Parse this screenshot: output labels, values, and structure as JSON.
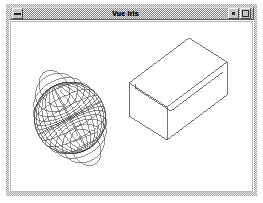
{
  "window": {
    "title": "Vue Iris",
    "menu_button": "window-menu",
    "minimize_button": "minimize",
    "maximize_button": "maximize",
    "background_color": "#ffffff",
    "frame_color": "#9a9a9a",
    "titlebar_color": "#c6c6c6"
  },
  "scene": {
    "name": "3d-wireframe-scene",
    "line_color": "#3a3a3a",
    "projection": "parallel",
    "objects": [
      {
        "name": "wireframe-sphere",
        "label": "Sphere",
        "type": "sphere",
        "center": [
          64,
          113
        ],
        "radius": 36,
        "meridians": 16,
        "parallels": 12,
        "tilt_deg": 28
      },
      {
        "name": "open-box",
        "label": "Box",
        "type": "box",
        "open_top": true,
        "front_left": [
          124,
          78
        ],
        "top_back": [
          184,
          33
        ],
        "right": [
          222,
          57
        ],
        "depth": 40
      }
    ]
  }
}
